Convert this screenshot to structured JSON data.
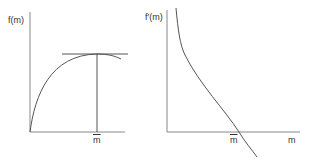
{
  "left_panel": {
    "y_label": "f(m)",
    "x_tick_label": "m",
    "curve": "concave increasing, maximum at m-bar",
    "tangent": "horizontal at maximum"
  },
  "right_panel": {
    "y_label": "f′(m)",
    "x_tick_label": "m",
    "x_axis_label": "m",
    "curve": "decreasing, crosses zero at m-bar"
  },
  "colors": {
    "line": "#555555",
    "text": "#333333"
  }
}
